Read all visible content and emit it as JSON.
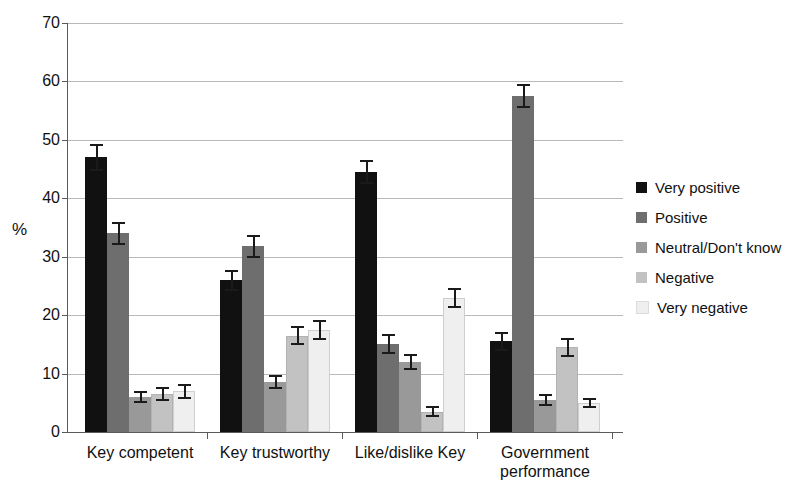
{
  "chart_data": {
    "type": "bar",
    "title": "",
    "xlabel": "",
    "ylabel": "%",
    "ylim": [
      0,
      70
    ],
    "yticks": [
      0,
      10,
      20,
      30,
      40,
      50,
      60,
      70
    ],
    "grid": true,
    "legend_position": "right",
    "error_bars": "95% confidence interval",
    "categories": [
      "Key competent",
      "Key trustworthy",
      "Like/dislike Key",
      "Government performance"
    ],
    "series": [
      {
        "name": "Very positive",
        "color": "#111111",
        "values": [
          47.0,
          26.0,
          44.5,
          15.5
        ],
        "err_low": [
          2.3,
          1.8,
          2.1,
          1.6
        ],
        "err_high": [
          2.3,
          1.8,
          2.1,
          1.6
        ]
      },
      {
        "name": "Positive",
        "color": "#6e6e6e",
        "values": [
          34.0,
          31.8,
          15.0,
          57.5
        ],
        "err_low": [
          2.0,
          2.0,
          1.7,
          2.0
        ],
        "err_high": [
          2.0,
          2.0,
          1.7,
          2.0
        ]
      },
      {
        "name": "Neutral/Don't know",
        "color": "#999999",
        "values": [
          6.0,
          8.5,
          12.0,
          5.5
        ],
        "err_low": [
          1.1,
          1.2,
          1.4,
          1.0
        ],
        "err_high": [
          1.1,
          1.2,
          1.4,
          1.0
        ]
      },
      {
        "name": "Negative",
        "color": "#c2c2c2",
        "values": [
          6.5,
          16.5,
          3.5,
          14.5
        ],
        "err_low": [
          1.2,
          1.6,
          0.9,
          1.6
        ],
        "err_high": [
          1.2,
          1.6,
          0.9,
          1.6
        ]
      },
      {
        "name": "Very negative",
        "color": "#efefef",
        "values": [
          7.0,
          17.5,
          23.0,
          5.0
        ],
        "err_low": [
          1.3,
          1.7,
          1.7,
          0.9
        ],
        "err_high": [
          1.3,
          1.7,
          1.7,
          0.9
        ]
      }
    ]
  },
  "axis": {
    "y_label": "%",
    "y_ticks": [
      "70",
      "60",
      "50",
      "40",
      "30",
      "20",
      "10",
      "0"
    ]
  },
  "x_axis": {
    "labels": [
      {
        "line1": "Key competent",
        "line2": ""
      },
      {
        "line1": "Key trustworthy",
        "line2": ""
      },
      {
        "line1": "Like/dislike Key",
        "line2": ""
      },
      {
        "line1": "Government",
        "line2": "performance"
      }
    ]
  },
  "legend": {
    "items": [
      {
        "label": "Very positive",
        "color": "#111111"
      },
      {
        "label": "Positive",
        "color": "#6e6e6e"
      },
      {
        "label": "Neutral/Don't know",
        "color": "#999999"
      },
      {
        "label": "Negative",
        "color": "#c2c2c2"
      },
      {
        "label": "Very negative",
        "color": "#efefef"
      }
    ]
  }
}
